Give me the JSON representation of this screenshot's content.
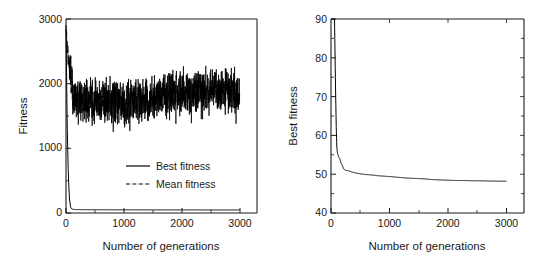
{
  "figure": {
    "background": "#ffffff",
    "ink": "#000000",
    "panel_count": 2
  },
  "chart_data": [
    {
      "panel": "left",
      "type": "line",
      "title": "",
      "xlabel": "Number of generations",
      "ylabel": "Fitness",
      "xlim": [
        0,
        3300
      ],
      "ylim": [
        0,
        3050
      ],
      "xticks": [
        0,
        1000,
        2000,
        3000
      ],
      "xtick_labels": [
        "0",
        "1000",
        "2000",
        "3000"
      ],
      "yticks": [
        0,
        1000,
        2000,
        3000
      ],
      "ytick_labels": [
        "0",
        "1000",
        "2000",
        "3000"
      ],
      "minor_xticks": [
        500,
        1500,
        2500
      ],
      "minor_yticks": [
        500,
        1500,
        2500
      ],
      "grid": false,
      "legend_position": "center-right",
      "legend": [
        {
          "label": "Best fitness",
          "style": "solid"
        },
        {
          "label": "Mean fitness",
          "style": "dashed"
        }
      ],
      "series": [
        {
          "name": "Best fitness",
          "style": "solid",
          "x": [
            0,
            20,
            40,
            60,
            80,
            100,
            150,
            300,
            600,
            1000,
            1500,
            2000,
            2500,
            3000
          ],
          "values": [
            2950,
            1400,
            600,
            220,
            90,
            62,
            55,
            52,
            51,
            50,
            49,
            49,
            48,
            48
          ]
        },
        {
          "name": "Mean fitness",
          "style": "dashed-noisy",
          "description": "Rapid drop from ~2900 at generation 0 to a noisy plateau; after generation ~120 oscillates between roughly 1250 and 2300 with a mean near 1850, drifting slightly upward over time.",
          "x": [
            0,
            20,
            40,
            60,
            80,
            100,
            120,
            200,
            400,
            600,
            800,
            1000,
            1200,
            1400,
            1600,
            1800,
            2000,
            2200,
            2400,
            2600,
            2800,
            3000
          ],
          "values": [
            2900,
            2620,
            2420,
            2300,
            2200,
            2050,
            1780,
            1720,
            1800,
            1760,
            1740,
            1700,
            1790,
            1800,
            1830,
            1900,
            1910,
            1900,
            1950,
            1940,
            1960,
            1900
          ],
          "band_low": 1250,
          "band_high": 2320,
          "band_mean": 1850
        }
      ]
    },
    {
      "panel": "right",
      "type": "line",
      "title": "",
      "xlabel": "Number of generations",
      "ylabel": "Best fitness",
      "xlim": [
        0,
        3300
      ],
      "ylim": [
        40,
        90
      ],
      "xticks": [
        0,
        1000,
        2000,
        3000
      ],
      "xtick_labels": [
        "0",
        "1000",
        "2000",
        "3000"
      ],
      "yticks": [
        40,
        50,
        60,
        70,
        80,
        90
      ],
      "ytick_labels": [
        "40",
        "50",
        "60",
        "70",
        "80",
        "90"
      ],
      "minor_xticks": [
        500,
        1500,
        2500
      ],
      "minor_yticks": [
        45,
        55,
        65,
        75,
        85
      ],
      "grid": false,
      "legend_position": "none",
      "series": [
        {
          "name": "Best fitness",
          "style": "solid",
          "x": [
            0,
            40,
            60,
            70,
            80,
            90,
            100,
            110,
            130,
            150,
            170,
            200,
            220,
            250,
            300,
            350,
            420,
            500,
            600,
            700,
            800,
            900,
            1000,
            1150,
            1300,
            1450,
            1600,
            1750,
            1900,
            2100,
            2300,
            2500,
            2700,
            2900,
            3000
          ],
          "values": [
            120,
            95,
            90,
            80,
            70,
            62,
            57,
            55.5,
            54.5,
            54,
            53,
            52,
            51.3,
            51,
            50.9,
            50.6,
            50.3,
            50.1,
            49.9,
            49.8,
            49.6,
            49.5,
            49.4,
            49.2,
            49.0,
            48.9,
            48.8,
            48.6,
            48.5,
            48.4,
            48.35,
            48.3,
            48.25,
            48.2,
            48.2
          ]
        }
      ]
    }
  ]
}
